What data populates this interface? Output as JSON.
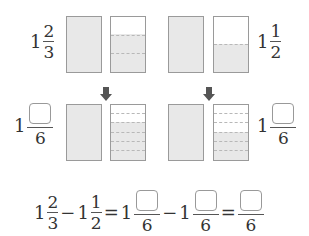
{
  "top": {
    "left_label": {
      "whole": "1",
      "numerator": "2",
      "denominator": "3"
    },
    "right_label": {
      "whole": "1",
      "numerator": "1",
      "denominator": "2"
    }
  },
  "bottom": {
    "left_label": {
      "whole": "1",
      "numerator_blank": true,
      "denominator": "6"
    },
    "right_label": {
      "whole": "1",
      "numerator_blank": true,
      "denominator": "6"
    }
  },
  "equation": {
    "term1": {
      "whole": "1",
      "numerator": "2",
      "denominator": "3"
    },
    "minus1": "−",
    "term2": {
      "whole": "1",
      "numerator": "1",
      "denominator": "2"
    },
    "equals1": "=",
    "term3": {
      "whole": "1",
      "denominator": "6"
    },
    "minus2": "−",
    "term4": {
      "whole": "1",
      "denominator": "6"
    },
    "equals2": "=",
    "result": {
      "denominator": "6"
    }
  },
  "colors": {
    "shade": "#e8e8e8",
    "border": "#9a9a9a",
    "arrow": "#555555"
  }
}
